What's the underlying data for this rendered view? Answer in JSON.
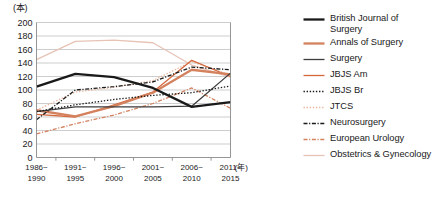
{
  "chart_data": {
    "type": "line",
    "title": "",
    "xlabel": "(年)",
    "ylabel": "(本)",
    "ylim": [
      0,
      200
    ],
    "yticks": [
      0,
      20,
      40,
      60,
      80,
      100,
      120,
      140,
      160,
      180,
      200
    ],
    "grid": true,
    "legend_position": "right",
    "categories": [
      "1986~\n1990",
      "1991~\n1995",
      "1996~\n2000",
      "2001~\n2005",
      "2006~\n2010",
      "2011~\n2015"
    ],
    "categories_top": [
      "1986~",
      "1991~",
      "1996~",
      "2001~",
      "2006~",
      "2011~"
    ],
    "categories_bottom": [
      "1990",
      "1995",
      "2000",
      "2005",
      "2010",
      "2015"
    ],
    "series": [
      {
        "name": "British Journal of Surgery",
        "color": "#1a1a1a",
        "width": 2.3,
        "dash": "none",
        "values": [
          105,
          124,
          119,
          103,
          75,
          82
        ]
      },
      {
        "name": "Annals of Surgery",
        "color": "#d4825e",
        "width": 2.3,
        "dash": "none",
        "values": [
          70,
          61,
          76,
          96,
          130,
          123
        ]
      },
      {
        "name": "Surgery",
        "color": "#3d3d3d",
        "width": 1.3,
        "dash": "none",
        "values": [
          68,
          75,
          75,
          75,
          76,
          125
        ]
      },
      {
        "name": "JBJS Am",
        "color": "#d4693e",
        "width": 1.3,
        "dash": "none",
        "values": [
          64,
          60,
          78,
          97,
          144,
          120
        ]
      },
      {
        "name": "JBJS Br",
        "color": "#1a1a1a",
        "width": 1.3,
        "dash": "1.4,1.7",
        "values": [
          68,
          78,
          86,
          92,
          96,
          106
        ]
      },
      {
        "name": "JTCS",
        "color": "#e8b49b",
        "width": 1.3,
        "dash": "1.4,1.7",
        "values": [
          70,
          97,
          104,
          114,
          142,
          122
        ]
      },
      {
        "name": "Neurosurgery",
        "color": "#1a1a1a",
        "width": 1.3,
        "dash": "4,1.6,1.2,1.6",
        "values": [
          56,
          100,
          105,
          112,
          134,
          130
        ]
      },
      {
        "name": "European Urology",
        "color": "#d4825e",
        "width": 1.3,
        "dash": "4,1.6,1.2,1.6",
        "values": [
          35,
          50,
          63,
          80,
          103,
          73
        ]
      },
      {
        "name": "Obstetrics & Gynecology",
        "color": "#e6c3b5",
        "width": 1.3,
        "dash": "none",
        "values": [
          145,
          172,
          174,
          170,
          137,
          119
        ]
      }
    ]
  },
  "legend": {
    "items": [
      {
        "label": "British Journal of Surgery"
      },
      {
        "label": "Annals of Surgery"
      },
      {
        "label": "Surgery"
      },
      {
        "label": "JBJS Am"
      },
      {
        "label": "JBJS Br"
      },
      {
        "label": "JTCS"
      },
      {
        "label": "Neurosurgery"
      },
      {
        "label": "European Urology"
      },
      {
        "label": "Obstetrics & Gynecology"
      }
    ]
  },
  "axes": {
    "y_unit": "(本)",
    "x_unit": "(年)"
  }
}
